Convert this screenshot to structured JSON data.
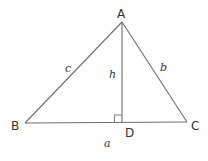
{
  "diagram": {
    "type": "triangle-with-altitude",
    "colors": {
      "stroke": "#6e6e6e",
      "text": "#333333",
      "background": "#ffffff"
    },
    "vertices": {
      "A": {
        "label": "A",
        "x": 122,
        "y": 22
      },
      "B": {
        "label": "B",
        "x": 25,
        "y": 123
      },
      "C": {
        "label": "C",
        "x": 187,
        "y": 122
      },
      "D": {
        "label": "D",
        "x": 122,
        "y": 122
      }
    },
    "sides": {
      "a": {
        "label": "a",
        "between": "B-C"
      },
      "b": {
        "label": "b",
        "between": "A-C"
      },
      "c": {
        "label": "c",
        "between": "A-B"
      },
      "h": {
        "label": "h",
        "between": "A-D",
        "kind": "altitude"
      }
    },
    "right_angle_marker": {
      "at": "D",
      "size": 7
    }
  }
}
